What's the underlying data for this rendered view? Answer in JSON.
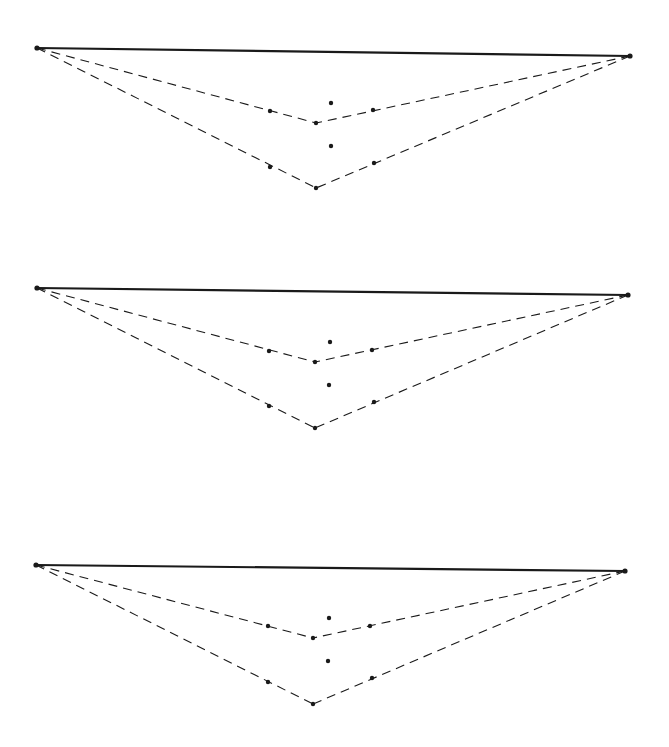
{
  "diagram": {
    "background": "#ffffff",
    "ink": "#1a1a1a",
    "panels": [
      {
        "name": "panel-1",
        "base": {
          "x1": 37,
          "y1": 48,
          "x2": 630,
          "y2": 56
        },
        "upper_vertex": {
          "x": 316,
          "y": 123
        },
        "lower_vertex": {
          "x": 316,
          "y": 188
        },
        "points": [
          {
            "x": 270,
            "y": 111
          },
          {
            "x": 373,
            "y": 110
          },
          {
            "x": 331,
            "y": 103
          },
          {
            "x": 331,
            "y": 146
          },
          {
            "x": 270,
            "y": 167
          },
          {
            "x": 374,
            "y": 163
          }
        ]
      },
      {
        "name": "panel-2",
        "base": {
          "x1": 37,
          "y1": 288,
          "x2": 628,
          "y2": 295
        },
        "upper_vertex": {
          "x": 315,
          "y": 362
        },
        "lower_vertex": {
          "x": 315,
          "y": 428
        },
        "points": [
          {
            "x": 269,
            "y": 351
          },
          {
            "x": 372,
            "y": 350
          },
          {
            "x": 330,
            "y": 342
          },
          {
            "x": 329,
            "y": 385
          },
          {
            "x": 269,
            "y": 406
          },
          {
            "x": 374,
            "y": 402
          }
        ]
      },
      {
        "name": "panel-3",
        "base": {
          "x1": 36,
          "y1": 565,
          "x2": 625,
          "y2": 571
        },
        "upper_vertex": {
          "x": 313,
          "y": 638
        },
        "lower_vertex": {
          "x": 313,
          "y": 704
        },
        "points": [
          {
            "x": 268,
            "y": 626
          },
          {
            "x": 370,
            "y": 626
          },
          {
            "x": 329,
            "y": 618
          },
          {
            "x": 328,
            "y": 661
          },
          {
            "x": 268,
            "y": 682
          },
          {
            "x": 372,
            "y": 678
          }
        ]
      }
    ]
  }
}
